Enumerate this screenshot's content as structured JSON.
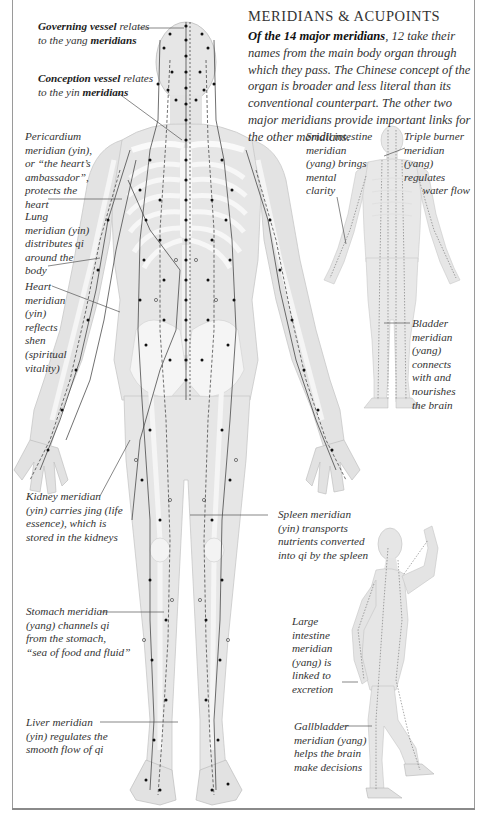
{
  "header": {
    "title": "MERIDIANS & ACUPOINTS",
    "intro_bold": "Of the 14 major meridians",
    "intro_rest": ", 12 take their names from the main body organ through which they pass. The Chinese concept of the organ is broader and less literal than its conventional counterpart. The other two major meridians provide important links for the other meridians."
  },
  "labels": [
    {
      "id": "governing",
      "lines": [
        [
          "b",
          "Governing vessel"
        ],
        [
          "t",
          " relates"
        ]
      ],
      "line2": [
        [
          "t",
          "to the yang "
        ],
        [
          "b",
          "meridians"
        ]
      ]
    },
    {
      "id": "conception"
    }
  ],
  "annotations": {
    "governing": {
      "l1_b": "Governing vessel",
      "l1_t": " relates",
      "l2_t": "to the yang ",
      "l2_b": "meridians"
    },
    "conception": {
      "l1_b": "Conception vessel",
      "l1_t": " relates",
      "l2_t": "to the yin ",
      "l2_b": "meridians"
    },
    "pericardium": {
      "lines": [
        "Pericardium",
        "meridian (yin),",
        "or “the heart’s",
        "ambassador”,",
        "protects the",
        "heart"
      ]
    },
    "lung": {
      "lines": [
        "Lung",
        "meridian (yin)",
        "distributes qi",
        "around the",
        "body"
      ]
    },
    "heart": {
      "lines": [
        "Heart",
        "meridian",
        "(yin)",
        "reflects",
        "shen",
        "(spiritual",
        "vitality)"
      ]
    },
    "kidney": {
      "lines": [
        "Kidney meridian",
        "(yin) carries jing (life",
        "essence), which is",
        "stored in the kidneys"
      ]
    },
    "stomach": {
      "lines": [
        "Stomach meridian",
        "(yang) channels qi",
        "from the stomach,",
        "“sea of food and fluid”"
      ]
    },
    "liver": {
      "lines": [
        "Liver meridian",
        "(yin) regulates the",
        "smooth flow of qi"
      ]
    },
    "small_intestine": {
      "lines": [
        "Small intestine",
        "meridian",
        "(yang) brings",
        "mental",
        "clarity"
      ]
    },
    "triple_burner": {
      "lines": [
        "Triple burner",
        "meridian",
        "(yang) regulates",
        "water flow"
      ]
    },
    "bladder": {
      "lines": [
        "Bladder",
        "meridian",
        "(yang)",
        "connects",
        "with and",
        "nourishes",
        "the brain"
      ]
    },
    "spleen": {
      "lines": [
        "Spleen meridian",
        "(yin) transports",
        "nutrients converted",
        "into qi by the spleen"
      ]
    },
    "large_intestine": {
      "lines": [
        "Large",
        "intestine",
        "meridian",
        "(yang) is",
        "linked to",
        "excretion"
      ]
    },
    "gallbladder": {
      "lines": [
        "Gallbladder",
        "meridian (yang)",
        "helps the brain",
        "make decisions"
      ]
    }
  },
  "figures": [
    {
      "name": "front-view-body",
      "description": "Front view of human body with skeleton, meridian lines and acupoints"
    },
    {
      "name": "back-view-body",
      "description": "Back view of human body with meridians"
    },
    {
      "name": "side-view-body",
      "description": "Side view of human body with raised arm showing meridians"
    }
  ],
  "colors": {
    "body_fill": "#e6e6e6",
    "bone_fill": "#f7f7f7",
    "point": "#111111",
    "line": "#333333",
    "frame": "#9a9a9a"
  }
}
